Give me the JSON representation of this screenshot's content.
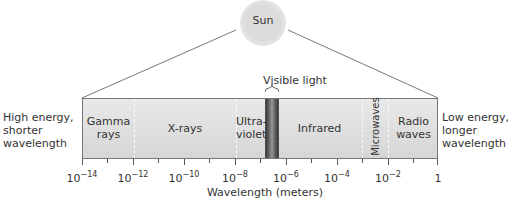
{
  "sun": {
    "label": "Sun"
  },
  "visible_light": {
    "label": "Visible light"
  },
  "left_note": [
    "High energy,",
    "shorter",
    "wavelength"
  ],
  "right_note": [
    "Low energy,",
    "longer",
    "wavelength"
  ],
  "bands": [
    {
      "lines": [
        "Gamma",
        "rays"
      ]
    },
    {
      "lines": [
        "X-rays"
      ]
    },
    {
      "lines": [
        "Ultra-",
        "violet"
      ]
    },
    {
      "lines": [
        "Infrared"
      ]
    },
    {
      "lines": [
        "Microwaves"
      ]
    },
    {
      "lines": [
        "Radio",
        "waves"
      ]
    }
  ],
  "axis": {
    "title": "Wavelength (meters)",
    "ticks": [
      {
        "base": "10",
        "exp": "−14"
      },
      {
        "base": "10",
        "exp": "−12"
      },
      {
        "base": "10",
        "exp": "−10"
      },
      {
        "base": "10",
        "exp": "−8"
      },
      {
        "base": "10",
        "exp": "−6"
      },
      {
        "base": "10",
        "exp": "−4"
      },
      {
        "base": "10",
        "exp": "−2"
      },
      {
        "base": "1",
        "exp": ""
      }
    ]
  },
  "colors": {
    "band_top": "#e9e9e9",
    "band_bottom": "#d6d6d6",
    "sun": "#dcdcdc",
    "line": "#555555"
  }
}
